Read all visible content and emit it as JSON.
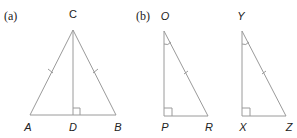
{
  "figure": {
    "parts": [
      {
        "label": "(a)",
        "type": "isosceles-triangle-with-altitude",
        "vertices": {
          "apex": "C",
          "left": "A",
          "right": "B",
          "foot": "D"
        },
        "marks": {
          "equal_sides": [
            "AC",
            "BC"
          ],
          "right_angle_at": "D"
        }
      },
      {
        "label": "(b)",
        "triangles": [
          {
            "vertices": {
              "top": "O",
              "bottom_left": "P",
              "bottom_right": "R"
            },
            "marks": {
              "right_angle_at": "P",
              "angle_arc_at": "O",
              "tick_on": "OR"
            }
          },
          {
            "vertices": {
              "top": "Y",
              "bottom_left": "X",
              "bottom_right": "Z"
            },
            "marks": {
              "right_angle_at": "X",
              "angle_arc_at": "Y",
              "tick_on": "YZ"
            }
          }
        ]
      }
    ]
  },
  "colors": {
    "line": "#9a9a9a",
    "text": "#222222"
  }
}
